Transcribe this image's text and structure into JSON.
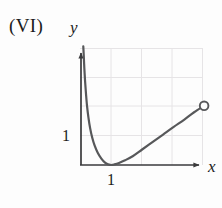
{
  "figure": {
    "panel_label": "(VI)",
    "background_color": "#fdfdfd",
    "curve_color": "#57585a",
    "axis_color": "#3a3a3c",
    "grid_color": "#e6e4e6",
    "text_color": "#1b1b1b"
  },
  "axes": {
    "x_label": "x",
    "y_label": "y",
    "x_tick_label": "1",
    "y_tick_label": "1"
  },
  "chart_data": {
    "type": "line",
    "title": "(VI)",
    "xlabel": "x",
    "ylabel": "y",
    "xlim": [
      0,
      4.7
    ],
    "ylim": [
      0,
      4.1
    ],
    "xticks": [
      1
    ],
    "xtick_labels": [
      "1"
    ],
    "yticks": [
      1
    ],
    "ytick_labels": [
      "1"
    ],
    "grid": true,
    "grid_x": [
      1,
      2,
      3,
      4
    ],
    "grid_y": [
      1,
      2,
      3
    ],
    "legend": null,
    "annotations": [
      {
        "kind": "open-circle-endpoint",
        "x": 4.05,
        "y": 2.02,
        "note": "open endpoint at right end of curve"
      },
      {
        "kind": "vertical-asymptote",
        "x": 0,
        "note": "curve rises steeply toward the y-axis"
      },
      {
        "kind": "minimum",
        "x": 1,
        "y": 0,
        "note": "curve touches the x-axis at x = 1"
      }
    ],
    "series": [
      {
        "name": "curve",
        "x": [
          0.075,
          0.09,
          0.11,
          0.135,
          0.165,
          0.2,
          0.245,
          0.3,
          0.37,
          0.45,
          0.55,
          0.67,
          0.8,
          0.9,
          1.0,
          1.1,
          1.25,
          1.45,
          1.7,
          2.0,
          2.35,
          2.7,
          3.05,
          3.4,
          3.72,
          4.05
        ],
        "y": [
          4.05,
          3.75,
          3.3,
          2.85,
          2.42,
          2.0,
          1.62,
          1.26,
          0.93,
          0.66,
          0.42,
          0.22,
          0.07,
          0.02,
          0.0,
          0.02,
          0.07,
          0.16,
          0.3,
          0.52,
          0.78,
          1.04,
          1.3,
          1.55,
          1.8,
          2.02
        ]
      }
    ]
  }
}
